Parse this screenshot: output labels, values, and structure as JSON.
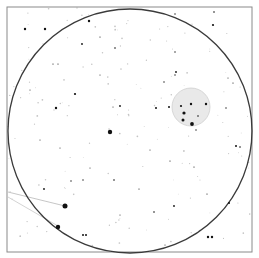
{
  "chart": {
    "type": "star-finder-chart",
    "frame": {
      "x": 7,
      "y": 7,
      "w": 245,
      "h": 245,
      "stroke": "#8a8a8a"
    },
    "field_circle": {
      "cx": 130,
      "cy": 131,
      "r": 122,
      "stroke": "#3a3a3a"
    },
    "cluster_circle": {
      "cx": 191,
      "cy": 107,
      "r": 19,
      "fill": "#e9e9e9",
      "stroke": "#cfcfcf"
    },
    "lines": [
      {
        "x1": 8,
        "y1": 192,
        "x2": 65,
        "y2": 206,
        "stroke": "#b8b8b8"
      },
      {
        "x1": 8,
        "y1": 197,
        "x2": 58,
        "y2": 226,
        "stroke": "#c8c8c8"
      }
    ],
    "stars": [
      {
        "x": 25,
        "y": 29,
        "r": 1.2
      },
      {
        "x": 45,
        "y": 29,
        "r": 1.2
      },
      {
        "x": 89,
        "y": 21,
        "r": 1.2
      },
      {
        "x": 82,
        "y": 44,
        "r": 0.9
      },
      {
        "x": 115,
        "y": 48,
        "r": 0.8
      },
      {
        "x": 75,
        "y": 94,
        "r": 1.1
      },
      {
        "x": 56,
        "y": 108,
        "r": 1.2
      },
      {
        "x": 120,
        "y": 106,
        "r": 0.9
      },
      {
        "x": 53,
        "y": 64,
        "r": 0.6
      },
      {
        "x": 58,
        "y": 64,
        "r": 0.6
      },
      {
        "x": 100,
        "y": 37,
        "r": 0.6
      },
      {
        "x": 113,
        "y": 107,
        "r": 0.5
      },
      {
        "x": 110,
        "y": 132,
        "r": 2.2
      },
      {
        "x": 44,
        "y": 189,
        "r": 0.9
      },
      {
        "x": 65,
        "y": 206,
        "r": 2.5
      },
      {
        "x": 58,
        "y": 227,
        "r": 2.2
      },
      {
        "x": 83,
        "y": 235,
        "r": 1.0
      },
      {
        "x": 86,
        "y": 235,
        "r": 1.0
      },
      {
        "x": 114,
        "y": 180,
        "r": 0.8
      },
      {
        "x": 71,
        "y": 181,
        "r": 0.7
      },
      {
        "x": 83,
        "y": 180,
        "r": 0.7
      },
      {
        "x": 213,
        "y": 25,
        "r": 1.1
      },
      {
        "x": 214,
        "y": 12,
        "r": 0.8
      },
      {
        "x": 175,
        "y": 14,
        "r": 0.7
      },
      {
        "x": 175,
        "y": 52,
        "r": 0.7
      },
      {
        "x": 176,
        "y": 72,
        "r": 0.9
      },
      {
        "x": 175,
        "y": 75,
        "r": 0.7
      },
      {
        "x": 156,
        "y": 108,
        "r": 1.0
      },
      {
        "x": 169,
        "y": 107,
        "r": 1.0
      },
      {
        "x": 181,
        "y": 106,
        "r": 1.1
      },
      {
        "x": 191,
        "y": 104,
        "r": 1.2
      },
      {
        "x": 206,
        "y": 104,
        "r": 1.2
      },
      {
        "x": 184,
        "y": 113,
        "r": 1.6
      },
      {
        "x": 183,
        "y": 120,
        "r": 1.5
      },
      {
        "x": 192,
        "y": 124,
        "r": 1.9
      },
      {
        "x": 198,
        "y": 116,
        "r": 0.8
      },
      {
        "x": 196,
        "y": 130,
        "r": 0.7
      },
      {
        "x": 164,
        "y": 82,
        "r": 0.7
      },
      {
        "x": 226,
        "y": 108,
        "r": 0.7
      },
      {
        "x": 236,
        "y": 146,
        "r": 1.0
      },
      {
        "x": 240,
        "y": 147,
        "r": 0.8
      },
      {
        "x": 229,
        "y": 203,
        "r": 1.0
      },
      {
        "x": 174,
        "y": 206,
        "r": 0.9
      },
      {
        "x": 154,
        "y": 212,
        "r": 0.8
      },
      {
        "x": 208,
        "y": 237,
        "r": 1.2
      },
      {
        "x": 212,
        "y": 237,
        "r": 1.2
      },
      {
        "x": 170,
        "y": 161,
        "r": 0.6
      },
      {
        "x": 207,
        "y": 194,
        "r": 0.6
      },
      {
        "x": 139,
        "y": 189,
        "r": 0.6
      },
      {
        "x": 194,
        "y": 167,
        "r": 0.6
      },
      {
        "x": 233,
        "y": 83,
        "r": 0.6
      },
      {
        "x": 60,
        "y": 148,
        "r": 0.5
      },
      {
        "x": 90,
        "y": 168,
        "r": 0.5
      },
      {
        "x": 228,
        "y": 78,
        "r": 0.5
      },
      {
        "x": 100,
        "y": 75,
        "r": 0.5
      },
      {
        "x": 30,
        "y": 90,
        "r": 0.5
      },
      {
        "x": 150,
        "y": 150,
        "r": 0.5
      },
      {
        "x": 120,
        "y": 215,
        "r": 0.5
      },
      {
        "x": 40,
        "y": 140,
        "r": 0.5
      },
      {
        "x": 165,
        "y": 245,
        "r": 0.5
      }
    ],
    "faint_star_color": "#c4c4c4",
    "star_color": "#111111"
  }
}
